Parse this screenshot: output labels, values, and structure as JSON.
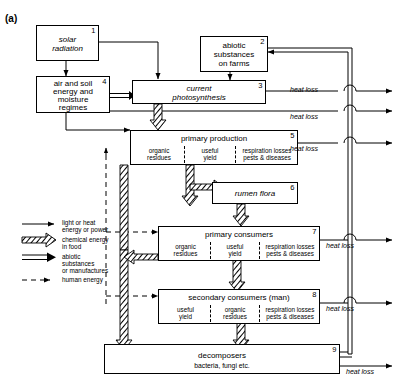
{
  "figure": {
    "panel_label": "(a)"
  },
  "boxes": [
    {
      "id": "solar-radiation",
      "num": "1",
      "title": "solar radiation",
      "italic": true,
      "cells": []
    },
    {
      "id": "abiotic-substances",
      "num": "2",
      "title": "abiotic substances on farms",
      "italic": false,
      "cells": []
    },
    {
      "id": "current-photosynthesis",
      "num": "3",
      "title": "current photosynthesis",
      "italic": true,
      "cells": []
    },
    {
      "id": "air-and-soil",
      "num": "4",
      "title": "air and soil energy and moisture regimes",
      "italic": false,
      "cells": []
    },
    {
      "id": "primary-production",
      "num": "5",
      "title": "primary production",
      "italic": false,
      "cells": [
        "organic residues",
        "useful yield",
        "respiration losses pests & diseases"
      ]
    },
    {
      "id": "rumen-flora",
      "num": "6",
      "title": "rumen flora",
      "italic": true,
      "cells": []
    },
    {
      "id": "primary-consumers",
      "num": "7",
      "title": "primary consumers",
      "italic": false,
      "cells": [
        "organic residues",
        "useful yield",
        "respiration losses pests & diseases"
      ]
    },
    {
      "id": "secondary-consumers",
      "num": "8",
      "title": "secondary consumers (man)",
      "italic": false,
      "cells": [
        "useful yield",
        "organic residues",
        "respiration losses pests & diseases"
      ]
    },
    {
      "id": "decomposers",
      "num": "9",
      "title": "decomposers",
      "italic": false,
      "subtitle": "bacteria, fungi etc.",
      "cells": []
    }
  ],
  "box_text": {
    "solar_line1": "solar",
    "solar_line2": "radiation",
    "abiotic_line1": "abiotic",
    "abiotic_line2": "substances",
    "abiotic_line3": "on farms",
    "photo_line1": "current",
    "photo_line2": "photosynthesis",
    "airsoil_line1": "air and soil",
    "airsoil_line2": "energy and",
    "airsoil_line3": "moisture",
    "airsoil_line4": "regimes",
    "primary_production": "primary production",
    "rumen_flora": "rumen flora",
    "primary_consumers": "primary consumers",
    "secondary_consumers": "secondary consumers (man)",
    "decomposers": "decomposers",
    "decomposers_sub": "bacteria, fungi etc.",
    "organic_l1": "organic",
    "organic_l2": "residues",
    "useful_l1": "useful",
    "useful_l2": "yield",
    "resp_l1": "respiration losses",
    "resp_l2": "pests & diseases"
  },
  "numbers": {
    "n1": "1",
    "n2": "2",
    "n3": "3",
    "n4": "4",
    "n5": "5",
    "n6": "6",
    "n7": "7",
    "n8": "8",
    "n9": "9"
  },
  "heat_loss_labels": [
    {
      "id": "heat-loss-photosynthesis",
      "text": "heat loss"
    },
    {
      "id": "heat-loss-airsoil",
      "text": "heat loss"
    },
    {
      "id": "heat-loss-primary-production",
      "text": "heat loss"
    },
    {
      "id": "heat-loss-primary-consumers",
      "text": "heat loss"
    },
    {
      "id": "heat-loss-secondary-consumers",
      "text": "heat loss"
    },
    {
      "id": "heat-loss-decomposers",
      "text": "heat loss"
    }
  ],
  "legend": {
    "items": [
      {
        "id": "legend-light-heat",
        "arrow": "solid-thin",
        "line1": "light or heat",
        "line2": "energy or power",
        "line3": ""
      },
      {
        "id": "legend-chemical",
        "arrow": "hatched-band",
        "line1": "chemical energy",
        "line2": "in food",
        "line3": ""
      },
      {
        "id": "legend-abiotic",
        "arrow": "double-line",
        "line1": "abiotic",
        "line2": "substances",
        "line3": "or manufactures"
      },
      {
        "id": "legend-human",
        "arrow": "dashed",
        "line1": "human energy",
        "line2": "",
        "line3": ""
      }
    ]
  },
  "colors": {
    "stroke": "#000000",
    "background": "#ffffff",
    "hatch": "#000000"
  }
}
